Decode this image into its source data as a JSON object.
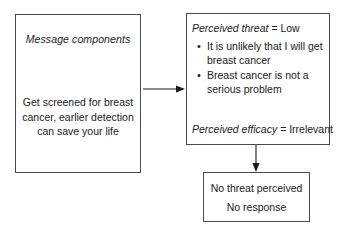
{
  "diagram": {
    "background_color": "#ffffff",
    "line_color": "#4a4a4a",
    "text_color": "#1a1a1a"
  },
  "message_box": {
    "heading": "Message components",
    "body": "Get screened for breast cancer, earlier detection can save your life"
  },
  "appraisal_box": {
    "threat_label": "Perceived threat",
    "threat_separator": " = ",
    "threat_value": "Low",
    "beliefs": [
      "It is unlikely that I will get breast cancer",
      "Breast cancer is not a serious problem"
    ],
    "efficacy_label": "Perceived efficacy",
    "efficacy_separator": " = ",
    "efficacy_value": "Irrelevant"
  },
  "outcome_box": {
    "line_1": "No threat perceived",
    "line_2": "No response"
  },
  "connectors": {
    "message_to_appraisal": "arrow-right",
    "appraisal_to_outcome": "arrow-down"
  }
}
